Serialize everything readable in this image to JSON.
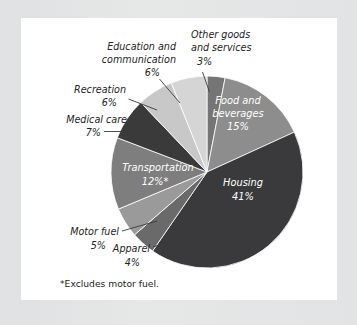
{
  "chart_data": {
    "type": "pie",
    "title": "",
    "subtitle": "",
    "xlabel": "",
    "ylabel": "",
    "legend_position": "none",
    "grid": false,
    "units": "percent",
    "categories": [
      "Other goods and services",
      "Food and beverages",
      "Housing",
      "Apparel",
      "Motor fuel",
      "Transportation",
      "Medical care",
      "Recreation",
      "Education and communication"
    ],
    "values": [
      3,
      15,
      41,
      4,
      5,
      12,
      7,
      6,
      6
    ],
    "slices": [
      {
        "name": "other-goods-and-services",
        "label_line1": "Other goods",
        "label_line2": "and services",
        "value_text": "3%",
        "value": 3,
        "color": "#757575",
        "label_placement": "outside"
      },
      {
        "name": "food-and-beverages",
        "label_line1": "Food and",
        "label_line2": "beverages",
        "value_text": "15%",
        "value": 15,
        "color": "#8d8d8d",
        "label_placement": "inside"
      },
      {
        "name": "housing",
        "label_line1": "Housing",
        "label_line2": "",
        "value_text": "41%",
        "value": 41,
        "color": "#3a3a3c",
        "label_placement": "inside"
      },
      {
        "name": "apparel",
        "label_line1": "Apparel",
        "label_line2": "",
        "value_text": "4%",
        "value": 4,
        "color": "#6a6a6a",
        "label_placement": "outside"
      },
      {
        "name": "motor-fuel",
        "label_line1": "Motor fuel",
        "label_line2": "",
        "value_text": "5%",
        "value": 5,
        "color": "#9a9a9a",
        "label_placement": "outside"
      },
      {
        "name": "transportation",
        "label_line1": "Transportation",
        "label_line2": "",
        "value_text": "12%*",
        "value": 12,
        "color": "#7e7e7e",
        "label_placement": "inside"
      },
      {
        "name": "medical-care",
        "label_line1": "Medical care",
        "label_line2": "",
        "value_text": "7%",
        "value": 7,
        "color": "#3a3a3a",
        "label_placement": "outside"
      },
      {
        "name": "recreation",
        "label_line1": "Recreation",
        "label_line2": "",
        "value_text": "6%",
        "value": 6,
        "color": "#c8c8c8",
        "label_placement": "outside"
      },
      {
        "name": "education-and-communication",
        "label_line1": "Education and",
        "label_line2": "communication",
        "value_text": "6%",
        "value": 6,
        "color": "#d5d5d5",
        "label_placement": "outside"
      }
    ],
    "footnote": "*Excludes motor fuel."
  },
  "colors": {
    "page_background": "#e3e4e5",
    "panel_background": "#ffffff",
    "rule": "#9a9c9e",
    "label_text": "#242424",
    "inside_label_text": "#ffffff"
  }
}
